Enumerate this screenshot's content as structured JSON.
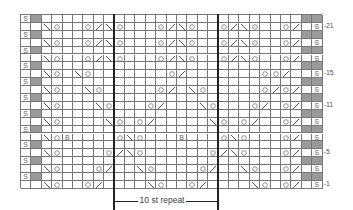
{
  "chart": {
    "title": "",
    "cols": 29,
    "rows": 22,
    "repeat_label": "10 st repeat",
    "repeat_start_col": 9,
    "repeat_end_col": 19,
    "row_labels": [
      {
        "row": 21,
        "text": "-21"
      },
      {
        "row": 15,
        "text": "-15"
      },
      {
        "row": 11,
        "text": "-11"
      },
      {
        "row": 5,
        "text": "-5"
      },
      {
        "row": 1,
        "text": "-1"
      }
    ],
    "edge_symbol": "S",
    "colors": {
      "gray": "#9a9a9a",
      "grid": "#777777",
      "repeat_line": "#222222"
    }
  },
  "symbols": {
    "1": [
      [
        2,
        "\\"
      ],
      [
        3,
        "O"
      ],
      [
        6,
        "O"
      ],
      [
        7,
        "/"
      ],
      [
        12,
        "\\"
      ],
      [
        13,
        "O"
      ],
      [
        16,
        "O"
      ],
      [
        17,
        "/"
      ],
      [
        22,
        "\\"
      ],
      [
        23,
        "O"
      ],
      [
        26,
        "/"
      ],
      [
        25,
        "O"
      ]
    ],
    "3": [
      [
        2,
        "\\"
      ],
      [
        3,
        "O"
      ],
      [
        7,
        "O"
      ],
      [
        8,
        "/"
      ],
      [
        11,
        "\\"
      ],
      [
        12,
        "O"
      ],
      [
        17,
        "O"
      ],
      [
        18,
        "/"
      ],
      [
        21,
        "\\"
      ],
      [
        22,
        "O"
      ],
      [
        25,
        "O"
      ],
      [
        26,
        "/"
      ]
    ],
    "5": [
      [
        2,
        "\\"
      ],
      [
        3,
        "O"
      ],
      [
        8,
        "O"
      ],
      [
        9,
        "/"
      ],
      [
        10,
        "\\"
      ],
      [
        11,
        "O"
      ],
      [
        18,
        "O"
      ],
      [
        19,
        "/"
      ],
      [
        20,
        "\\"
      ],
      [
        21,
        "O"
      ],
      [
        25,
        "O"
      ],
      [
        26,
        "/"
      ]
    ],
    "7": [
      [
        2,
        "\\"
      ],
      [
        3,
        "O"
      ],
      [
        4,
        "B"
      ],
      [
        9,
        "O"
      ],
      [
        10,
        "\\"
      ],
      [
        11,
        "O"
      ],
      [
        15,
        "B"
      ],
      [
        19,
        "O"
      ],
      [
        20,
        "\\"
      ],
      [
        21,
        "O"
      ],
      [
        25,
        "O"
      ],
      [
        26,
        "/"
      ]
    ],
    "9": [
      [
        2,
        "\\"
      ],
      [
        3,
        "O"
      ],
      [
        8,
        "\\"
      ],
      [
        9,
        "O"
      ],
      [
        11,
        "O"
      ],
      [
        12,
        "/"
      ],
      [
        18,
        "\\"
      ],
      [
        19,
        "O"
      ],
      [
        21,
        "O"
      ],
      [
        22,
        "/"
      ],
      [
        25,
        "O"
      ],
      [
        26,
        "/"
      ]
    ],
    "11": [
      [
        2,
        "\\"
      ],
      [
        3,
        "O"
      ],
      [
        7,
        "\\"
      ],
      [
        8,
        "O"
      ],
      [
        12,
        "O"
      ],
      [
        13,
        "/"
      ],
      [
        17,
        "\\"
      ],
      [
        18,
        "O"
      ],
      [
        22,
        "O"
      ],
      [
        23,
        "/"
      ],
      [
        25,
        "O"
      ],
      [
        26,
        "/"
      ]
    ],
    "13": [
      [
        2,
        "\\"
      ],
      [
        3,
        "O"
      ],
      [
        6,
        "\\"
      ],
      [
        7,
        "O"
      ],
      [
        13,
        "O"
      ],
      [
        14,
        "/"
      ],
      [
        16,
        "\\"
      ],
      [
        17,
        "O"
      ],
      [
        23,
        "O"
      ],
      [
        24,
        "/"
      ],
      [
        25,
        "O"
      ],
      [
        26,
        "/"
      ]
    ],
    "15": [
      [
        2,
        "\\"
      ],
      [
        3,
        "O"
      ],
      [
        5,
        "\\"
      ],
      [
        6,
        "O"
      ],
      [
        14,
        "O"
      ],
      [
        15,
        "/"
      ],
      [
        24,
        "O"
      ],
      [
        25,
        "/"
      ],
      [
        23,
        "O"
      ]
    ],
    "17": [
      [
        2,
        "\\"
      ],
      [
        3,
        "O"
      ],
      [
        6,
        "O"
      ],
      [
        7,
        "/"
      ],
      [
        8,
        "\\"
      ],
      [
        9,
        "O"
      ],
      [
        13,
        "O"
      ],
      [
        14,
        "/"
      ],
      [
        15,
        "\\"
      ],
      [
        16,
        "O"
      ],
      [
        19,
        "O"
      ],
      [
        20,
        "/"
      ],
      [
        21,
        "\\"
      ],
      [
        22,
        "O"
      ],
      [
        25,
        "O"
      ],
      [
        26,
        "/"
      ]
    ],
    "19": [
      [
        2,
        "\\"
      ],
      [
        3,
        "O"
      ],
      [
        6,
        "O"
      ],
      [
        7,
        "/"
      ],
      [
        8,
        "\\"
      ],
      [
        9,
        "O"
      ],
      [
        13,
        "O"
      ],
      [
        14,
        "/"
      ],
      [
        15,
        "\\"
      ],
      [
        16,
        "O"
      ],
      [
        19,
        "O"
      ],
      [
        20,
        "/"
      ],
      [
        21,
        "\\"
      ],
      [
        22,
        "O"
      ],
      [
        25,
        "O"
      ],
      [
        26,
        "/"
      ]
    ],
    "21": [
      [
        2,
        "\\"
      ],
      [
        3,
        "O"
      ],
      [
        6,
        "O"
      ],
      [
        7,
        "/"
      ],
      [
        8,
        "\\"
      ],
      [
        9,
        "O"
      ],
      [
        13,
        "O"
      ],
      [
        14,
        "/"
      ],
      [
        15,
        "\\"
      ],
      [
        16,
        "O"
      ],
      [
        19,
        "O"
      ],
      [
        20,
        "/"
      ],
      [
        21,
        "\\"
      ],
      [
        22,
        "O"
      ],
      [
        25,
        "O"
      ],
      [
        26,
        "/"
      ]
    ]
  }
}
